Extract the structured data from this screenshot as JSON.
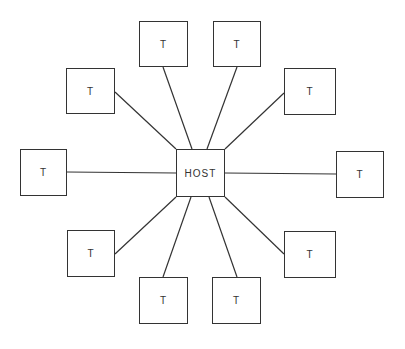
{
  "diagram": {
    "type": "star-topology",
    "host": {
      "label": "HOST",
      "x": 176,
      "y": 149,
      "w": 49,
      "h": 48
    },
    "terminals": [
      {
        "label": "T",
        "x": 139,
        "y": 21,
        "w": 49,
        "h": 46,
        "ax": 163,
        "ay": 67,
        "hx": 192,
        "hy": 149
      },
      {
        "label": "T",
        "x": 213,
        "y": 21,
        "w": 48,
        "h": 46,
        "ax": 237,
        "ay": 67,
        "hx": 207,
        "hy": 149
      },
      {
        "label": "T",
        "x": 66,
        "y": 68,
        "w": 49,
        "h": 46,
        "ax": 115,
        "ay": 92,
        "hx": 176,
        "hy": 149
      },
      {
        "label": "T",
        "x": 284,
        "y": 68,
        "w": 52,
        "h": 47,
        "ax": 284,
        "ay": 93,
        "hx": 225,
        "hy": 149
      },
      {
        "label": "T",
        "x": 20,
        "y": 149,
        "w": 47,
        "h": 47,
        "ax": 67,
        "ay": 172,
        "hx": 176,
        "hy": 173
      },
      {
        "label": "T",
        "x": 336,
        "y": 151,
        "w": 48,
        "h": 47,
        "ax": 336,
        "ay": 174,
        "hx": 225,
        "hy": 173
      },
      {
        "label": "T",
        "x": 67,
        "y": 230,
        "w": 48,
        "h": 47,
        "ax": 115,
        "ay": 254,
        "hx": 176,
        "hy": 197
      },
      {
        "label": "T",
        "x": 284,
        "y": 231,
        "w": 52,
        "h": 47,
        "ax": 284,
        "ay": 254,
        "hx": 225,
        "hy": 197
      },
      {
        "label": "T",
        "x": 139,
        "y": 277,
        "w": 49,
        "h": 47,
        "ax": 163,
        "ay": 277,
        "hx": 191,
        "hy": 197
      },
      {
        "label": "T",
        "x": 212,
        "y": 277,
        "w": 49,
        "h": 47,
        "ax": 237,
        "ay": 277,
        "hx": 209,
        "hy": 197
      }
    ]
  }
}
